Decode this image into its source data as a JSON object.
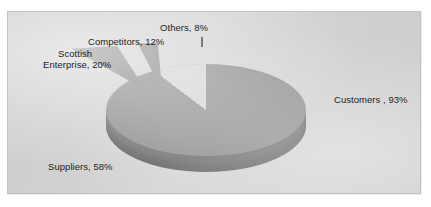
{
  "figure": {
    "name": "pie-chart-figure",
    "background_color": "#ffffff",
    "plot_background_color": "#d4d4d4",
    "frame_border_color": "#c2c2c2"
  },
  "chart_data": {
    "type": "pie",
    "title": "",
    "subtitle": "",
    "xlabel": "",
    "ylabel": "",
    "grid": false,
    "legend_position": "none",
    "label_format": "{category}, {value}%",
    "style": "3d-exploded-grayscale",
    "note": "Percentages total 191% — multiple-response survey, slices are not proportional shares of 100%",
    "categories": [
      "Customers ",
      "Suppliers",
      "Scottish Enterprise",
      "Competitors",
      "Others"
    ],
    "values": [
      93,
      58,
      20,
      12,
      8
    ],
    "labels": [
      "Customers , 93%",
      "Suppliers, 58%",
      "Scottish Enterprise, 20%",
      "Competitors, 12%",
      "Others, 8%"
    ],
    "slice_colors": [
      "#8d8d8d",
      "#8d8d8d",
      "#8a8a8a",
      "#8a8a8a",
      "#8b8b8b"
    ],
    "side_wall_color": "#6a6a6a",
    "exploded": [
      "Scottish Enterprise",
      "Competitors",
      "Others"
    ]
  },
  "labels": {
    "others": "Others, 8%",
    "competitors": "Competitors, 12%",
    "scottish_line1": "Scottish",
    "scottish_line2": "Enterprise, 20%",
    "customers": "Customers , 93%",
    "suppliers": "Suppliers, 58%"
  }
}
